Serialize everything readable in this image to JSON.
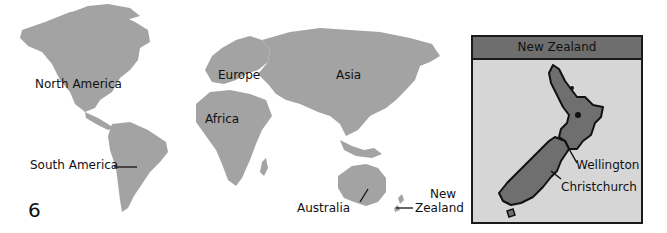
{
  "page_number": "6",
  "colors": {
    "land": "#a3a3a3",
    "inset_bg": "#d6d6d6",
    "inset_header": "#6e6e6e",
    "nz_fill": "#6f6f6f",
    "outline": "#1a1a1a"
  },
  "world_map": {
    "labels": {
      "north_america": "North America",
      "south_america": "South America",
      "europe": "Europe",
      "africa": "Africa",
      "asia": "Asia",
      "australia": "Australia",
      "new_zealand_line1": "New",
      "new_zealand_line2": "Zealand"
    }
  },
  "inset": {
    "title": "New Zealand",
    "cities": {
      "wellington": "Wellington",
      "christchurch": "Christchurch"
    }
  }
}
